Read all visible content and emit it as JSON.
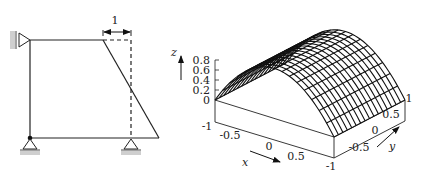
{
  "frame_diagram": {
    "dimension_label": "1",
    "description": "Frame structure with pin supports; deformed shape dashed"
  },
  "surface_plot": {
    "z_axis_label": "z",
    "x_axis_label": "x",
    "y_axis_label": "y",
    "z_ticks": [
      "0.8",
      "0.6",
      "0.4",
      "0.2",
      "0"
    ],
    "x_ticks": [
      "-1",
      "-0.5",
      "0",
      "0.5",
      "-1"
    ],
    "y_ticks": [
      "-0.5",
      "0",
      "0.5",
      "1"
    ]
  },
  "chart_data": {
    "type": "surface",
    "title": "",
    "xlabel": "x",
    "ylabel": "y",
    "zlabel": "z",
    "xlim": [
      -1,
      1
    ],
    "ylim": [
      -1,
      1
    ],
    "zlim": [
      0,
      0.8
    ],
    "z_ticks": [
      0,
      0.2,
      0.4,
      0.6,
      0.8
    ],
    "x_ticks": [
      -1,
      -0.5,
      0,
      0.5
    ],
    "y_ticks": [
      -0.5,
      0,
      0.5,
      1
    ],
    "function": "z ≈ 1 - x^2 (cylindrical parabola, independent of y)",
    "grid": "wireframe mesh ~17x17"
  }
}
